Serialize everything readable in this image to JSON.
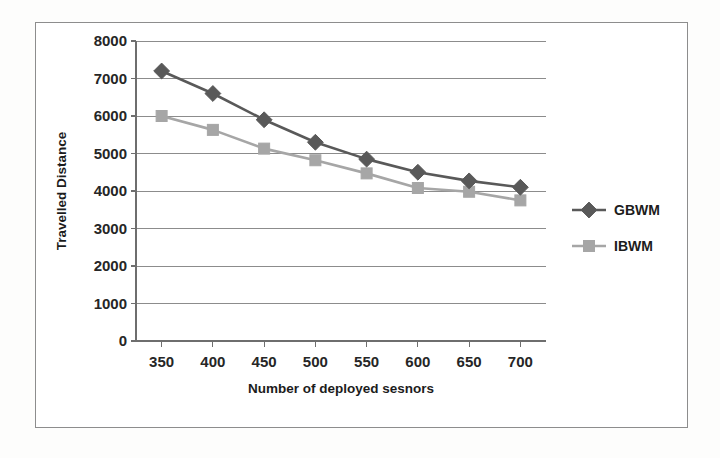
{
  "chart_data": {
    "type": "line",
    "title": "",
    "xlabel": "Number of deployed sesnors",
    "ylabel": "Travelled Distance",
    "x": [
      350,
      400,
      450,
      500,
      550,
      600,
      650,
      700
    ],
    "categories": [
      "350",
      "400",
      "450",
      "500",
      "550",
      "600",
      "650",
      "700"
    ],
    "xtick_labels": [
      "350",
      "400",
      "450",
      "500",
      "550",
      "600",
      "650",
      "700"
    ],
    "ytick_labels": [
      "0",
      "1000",
      "2000",
      "3000",
      "4000",
      "5000",
      "6000",
      "7000",
      "8000"
    ],
    "ytick_values": [
      0,
      1000,
      2000,
      3000,
      4000,
      5000,
      6000,
      7000,
      8000
    ],
    "ylim": [
      0,
      8000
    ],
    "xlim": [
      325,
      725
    ],
    "grid": "horizontal",
    "legend_position": "right",
    "series": [
      {
        "name": "GBWM",
        "marker": "diamond",
        "color": "#595959",
        "values": [
          7200,
          6600,
          5900,
          5300,
          4850,
          4500,
          4270,
          4100
        ]
      },
      {
        "name": "IBWM",
        "marker": "square",
        "color": "#a6a6a6",
        "values": [
          6000,
          5630,
          5130,
          4820,
          4470,
          4080,
          3980,
          3750
        ]
      }
    ]
  },
  "legend": {
    "items": [
      {
        "label": "GBWM"
      },
      {
        "label": "IBWM"
      }
    ]
  },
  "colors": {
    "series_dark": "#595959",
    "series_light": "#a6a6a6",
    "grid": "#8c8c8c",
    "axis": "#6e6e6e",
    "frame": "#8d8d8d",
    "text": "#1c1c1c"
  }
}
